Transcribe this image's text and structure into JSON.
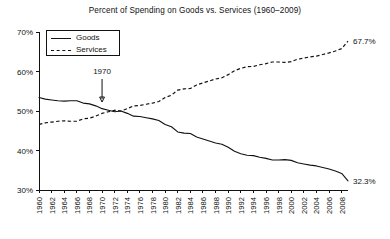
{
  "chart_data": {
    "type": "line",
    "title": "Percent of Spending on Goods vs. Services (1960–2009)",
    "xlabel": "",
    "ylabel": "",
    "ylim": [
      30,
      70
    ],
    "xlim": [
      1960,
      2009
    ],
    "grid": false,
    "legend_position": "top-left",
    "ytick_labels": [
      "70%",
      "60%",
      "50%",
      "40%",
      "30%"
    ],
    "ytick_values": [
      70,
      60,
      50,
      40,
      30
    ],
    "xtick_labels": [
      "1960",
      "1962",
      "1964",
      "1966",
      "1968",
      "1970",
      "1972",
      "1974",
      "1976",
      "1978",
      "1980",
      "1982",
      "1984",
      "1986",
      "1988",
      "1990",
      "1992",
      "1994",
      "1996",
      "1998",
      "2000",
      "2002",
      "2004",
      "2006",
      "2008"
    ],
    "xtick_values": [
      1960,
      1962,
      1964,
      1966,
      1968,
      1970,
      1972,
      1974,
      1976,
      1978,
      1980,
      1982,
      1984,
      1986,
      1988,
      1990,
      1992,
      1994,
      1996,
      1998,
      2000,
      2002,
      2004,
      2006,
      2008
    ],
    "x": [
      1960,
      1961,
      1962,
      1963,
      1964,
      1965,
      1966,
      1967,
      1968,
      1969,
      1970,
      1971,
      1972,
      1973,
      1974,
      1975,
      1976,
      1977,
      1978,
      1979,
      1980,
      1981,
      1982,
      1983,
      1984,
      1985,
      1986,
      1987,
      1988,
      1989,
      1990,
      1991,
      1992,
      1993,
      1994,
      1995,
      1996,
      1997,
      1998,
      1999,
      2000,
      2001,
      2002,
      2003,
      2004,
      2005,
      2006,
      2007,
      2008,
      2009
    ],
    "series": [
      {
        "name": "Goods",
        "style": "solid",
        "values": [
          53.4,
          53.0,
          52.8,
          52.6,
          52.5,
          52.6,
          52.6,
          52.0,
          51.8,
          51.3,
          50.6,
          50.2,
          49.8,
          50.0,
          49.4,
          48.7,
          48.6,
          48.3,
          48.0,
          47.6,
          46.6,
          46.0,
          44.7,
          44.4,
          44.3,
          43.4,
          42.9,
          42.4,
          41.9,
          41.6,
          40.8,
          39.8,
          39.2,
          38.8,
          38.7,
          38.3,
          38.0,
          37.6,
          37.6,
          37.7,
          37.5,
          36.9,
          36.6,
          36.3,
          36.1,
          35.7,
          35.3,
          34.8,
          34.2,
          32.3
        ]
      },
      {
        "name": "Services",
        "style": "dashed",
        "values": [
          46.6,
          47.0,
          47.2,
          47.4,
          47.5,
          47.4,
          47.4,
          48.0,
          48.2,
          48.7,
          49.4,
          49.8,
          50.2,
          50.0,
          50.6,
          51.3,
          51.4,
          51.7,
          52.0,
          52.4,
          53.4,
          54.0,
          55.3,
          55.6,
          55.7,
          56.6,
          57.1,
          57.6,
          58.1,
          58.4,
          59.2,
          60.2,
          60.8,
          61.2,
          61.3,
          61.7,
          62.0,
          62.4,
          62.4,
          62.3,
          62.5,
          63.1,
          63.4,
          63.7,
          63.9,
          64.3,
          64.7,
          65.2,
          65.8,
          67.7
        ]
      }
    ],
    "endpoint_labels": [
      {
        "series": "Services",
        "text": "67.7%",
        "value": 67.7,
        "year": 2009
      },
      {
        "series": "Goods",
        "text": "32.3%",
        "value": 32.3,
        "year": 2009
      }
    ],
    "annotations": [
      {
        "text": "1970",
        "year": 1970,
        "type": "arrow-down"
      }
    ]
  },
  "legend": {
    "items": [
      {
        "label": "Goods",
        "style": "solid"
      },
      {
        "label": "Services",
        "style": "dashed"
      }
    ]
  }
}
